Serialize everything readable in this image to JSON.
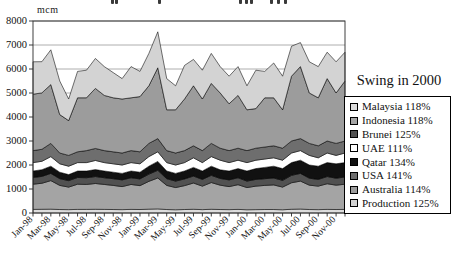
{
  "page": {
    "width": 455,
    "height": 258,
    "background": "#ffffff"
  },
  "top_clipped_title": {
    "visible": true,
    "fragment_marks_x": [
      111,
      115,
      158,
      239,
      245,
      250,
      270,
      277,
      284
    ]
  },
  "y_axis": {
    "unit_label": "mcm",
    "tick_labels": [
      "0",
      "1000",
      "2000",
      "3000",
      "4000",
      "5000",
      "6000",
      "7000",
      "8000"
    ],
    "min": 0,
    "max": 8000,
    "step": 1000
  },
  "x_axis": {
    "labels_shown": [
      "Jan-98",
      "Mar-98",
      "May-98",
      "Jul-98",
      "Sep-98",
      "Nov-98",
      "Jan-99",
      "Mar-99",
      "May-99",
      "Jul-99",
      "Sep-99",
      "Nov-99",
      "Jan-00",
      "Mar-00",
      "May-00",
      "Jul-00",
      "Sep-00",
      "Nov-00"
    ],
    "label_every_n_months": 2
  },
  "legend": {
    "title": "Swing in 2000",
    "items": [
      {
        "label": "Malaysia 118%",
        "color": "#dcdcdc"
      },
      {
        "label": "Indonesia 118%",
        "color": "#a4a4a4"
      },
      {
        "label": "Brunei 125%",
        "color": "#515151"
      },
      {
        "label": "UAE 111%",
        "color": "#ffffff"
      },
      {
        "label": "Qatar 134%",
        "color": "#111111"
      },
      {
        "label": "USA 141%",
        "color": "#6e6e6e"
      },
      {
        "label": "Australia 114%",
        "color": "#9c9c9c"
      },
      {
        "label": "Production 125%",
        "color": "#d3d3d3"
      }
    ]
  },
  "chart_data": {
    "type": "area",
    "stacked": true,
    "title": "",
    "ylabel": "mcm",
    "ylim": [
      0,
      8000
    ],
    "ytick_step": 1000,
    "grid": "horizontal",
    "legend_position": "right",
    "x": [
      "Jan-98",
      "Feb-98",
      "Mar-98",
      "Apr-98",
      "May-98",
      "Jun-98",
      "Jul-98",
      "Aug-98",
      "Sep-98",
      "Oct-98",
      "Nov-98",
      "Dec-98",
      "Jan-99",
      "Feb-99",
      "Mar-99",
      "Apr-99",
      "May-99",
      "Jun-99",
      "Jul-99",
      "Aug-99",
      "Sep-99",
      "Oct-99",
      "Nov-99",
      "Dec-99",
      "Jan-00",
      "Feb-00",
      "Mar-00",
      "Apr-00",
      "May-00",
      "Jun-00",
      "Jul-00",
      "Aug-00",
      "Sep-00",
      "Oct-00",
      "Nov-00",
      "Dec-00"
    ],
    "series": [
      {
        "name": "Malaysia",
        "color": "#dcdcdc",
        "values": [
          150,
          155,
          160,
          145,
          140,
          150,
          150,
          155,
          150,
          145,
          140,
          150,
          145,
          160,
          170,
          145,
          135,
          145,
          155,
          140,
          155,
          145,
          140,
          150,
          135,
          140,
          145,
          145,
          135,
          155,
          165,
          145,
          140,
          150,
          145,
          150
        ]
      },
      {
        "name": "Indonesia",
        "color": "#a4a4a4",
        "values": [
          1050,
          1085,
          1190,
          1005,
          940,
          1050,
          1040,
          1075,
          1040,
          1005,
          960,
          1040,
          995,
          1160,
          1290,
          1005,
          925,
          995,
          1095,
          980,
          1115,
          1015,
          960,
          1030,
          925,
          980,
          1005,
          1025,
          945,
          1105,
          1165,
          1015,
          980,
          1070,
          1015,
          1050
        ]
      },
      {
        "name": "Brunei",
        "color": "#515151",
        "values": [
          280,
          285,
          300,
          280,
          270,
          280,
          280,
          290,
          280,
          280,
          280,
          280,
          280,
          300,
          320,
          280,
          270,
          280,
          290,
          280,
          300,
          280,
          280,
          290,
          270,
          280,
          280,
          290,
          280,
          310,
          320,
          290,
          280,
          300,
          290,
          300
        ]
      },
      {
        "name": "Qatar",
        "color": "#111111",
        "values": [
          270,
          280,
          300,
          270,
          250,
          270,
          280,
          290,
          280,
          270,
          270,
          280,
          280,
          330,
          370,
          320,
          320,
          330,
          360,
          350,
          380,
          360,
          370,
          380,
          420,
          450,
          470,
          490,
          490,
          530,
          550,
          550,
          550,
          580,
          600,
          600
        ]
      },
      {
        "name": "UAE",
        "color": "#ffffff",
        "values": [
          350,
          350,
          400,
          350,
          350,
          350,
          350,
          380,
          350,
          350,
          350,
          350,
          350,
          400,
          400,
          350,
          350,
          350,
          400,
          350,
          400,
          400,
          350,
          350,
          350,
          350,
          350,
          350,
          350,
          400,
          400,
          400,
          350,
          400,
          350,
          400
        ]
      },
      {
        "name": "USA",
        "color": "#6e6e6e",
        "values": [
          500,
          500,
          550,
          450,
          450,
          450,
          500,
          500,
          500,
          500,
          500,
          500,
          500,
          550,
          550,
          500,
          500,
          500,
          500,
          500,
          550,
          500,
          500,
          500,
          500,
          500,
          500,
          500,
          500,
          500,
          500,
          500,
          500,
          500,
          500,
          500
        ]
      },
      {
        "name": "Australia",
        "color": "#9c9c9c",
        "values": [
          2350,
          2350,
          2450,
          1600,
          1450,
          2250,
          2200,
          2500,
          2300,
          2250,
          2250,
          2200,
          2300,
          2400,
          2950,
          1700,
          1800,
          2150,
          2500,
          2150,
          2500,
          2300,
          1950,
          2200,
          1700,
          1650,
          2050,
          2000,
          1600,
          2700,
          3000,
          2100,
          2000,
          2600,
          2100,
          2500
        ]
      },
      {
        "name": "Production",
        "color": "#d3d3d3",
        "values": [
          1350,
          1300,
          1450,
          1400,
          900,
          1100,
          1150,
          1250,
          1200,
          1050,
          850,
          1300,
          1050,
          1350,
          1500,
          1300,
          1000,
          1400,
          1100,
          1200,
          1250,
          1100,
          1150,
          1200,
          1000,
          1600,
          1100,
          1450,
          1400,
          1250,
          1000,
          1300,
          1300,
          1100,
          1300,
          1200
        ]
      }
    ],
    "note_stacking": "bottom-to-top: Malaysia, Indonesia, Brunei, Qatar, UAE, USA, Australia, Production"
  },
  "plot": {
    "left": 33,
    "top": 21,
    "right": 345,
    "bottom": 213
  }
}
